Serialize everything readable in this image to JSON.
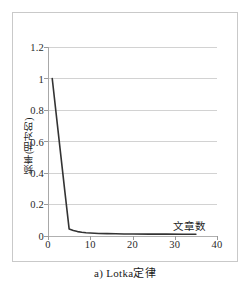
{
  "caption": "a) Lotka定律",
  "chart_data": {
    "type": "line",
    "title": "",
    "subtitle": "",
    "caption": "a) Lotka定律",
    "xlabel": "文章数",
    "ylabel": "频率(相对的)",
    "xlim": [
      0,
      40
    ],
    "ylim": [
      0,
      1.2
    ],
    "xticks": [
      0,
      10,
      20,
      30,
      40
    ],
    "xtick_labels": [
      "0",
      "10",
      "20",
      "30",
      "40"
    ],
    "yticks": [
      0,
      0.2,
      0.4,
      0.6,
      0.8,
      1,
      1.2
    ],
    "ytick_labels": [
      "0",
      "0.2",
      "0.4",
      "0.6",
      "0.8",
      "1",
      "1.2"
    ],
    "grid": "horizontal",
    "legend": "none",
    "line_color": "#333333",
    "gridline_color": "#d2d2d2",
    "axis_color": "#a8a8a8",
    "series": [
      {
        "name": "Lotka's law",
        "x": [
          1,
          2,
          3,
          4,
          5,
          6,
          7,
          8,
          9,
          10,
          12,
          14,
          16,
          18,
          20,
          24,
          28,
          32,
          35
        ],
        "y": [
          1.0,
          0.76,
          0.52,
          0.28,
          0.045,
          0.035,
          0.028,
          0.024,
          0.021,
          0.019,
          0.016,
          0.015,
          0.014,
          0.013,
          0.013,
          0.012,
          0.012,
          0.011,
          0.011
        ]
      }
    ],
    "annotations": [
      {
        "text": "文章数",
        "x": 31,
        "y": 0.115
      }
    ]
  }
}
